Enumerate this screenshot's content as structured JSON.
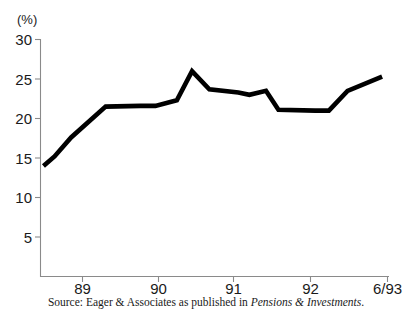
{
  "source_note": {
    "prefix": "Source: Eager & Associates as published in ",
    "publication": "Pensions & Investments",
    "suffix": "."
  },
  "chart_data": {
    "type": "line",
    "title": "",
    "subtitle": "",
    "xlabel": "",
    "ylabel": "",
    "unit_label": "(%)",
    "ylim": [
      0,
      30
    ],
    "yticks": [
      5,
      10,
      15,
      20,
      25,
      30
    ],
    "ytick_labels": [
      "5",
      "10",
      "15",
      "20",
      "25",
      "30"
    ],
    "xtick_labels": [
      "89",
      "90",
      "91",
      "92",
      "6/93"
    ],
    "xtick_values": [
      1989,
      1990,
      1991,
      1992,
      1993.5
    ],
    "xlim": [
      1988.55,
      1993.6
    ],
    "grid": false,
    "legend": null,
    "line_color": "#000000",
    "axis_color": "#8a8a8a",
    "series": [
      {
        "name": "Percent",
        "x": [
          1988.6,
          1988.76,
          1989.0,
          1989.5,
          1990.0,
          1990.22,
          1990.53,
          1990.75,
          1991.0,
          1991.42,
          1991.58,
          1991.82,
          1992.0,
          1992.53,
          1992.73,
          1993.0,
          1993.5
        ],
        "values": [
          14.0,
          15.2,
          17.6,
          21.5,
          21.6,
          21.6,
          22.3,
          26.0,
          23.7,
          23.3,
          23.0,
          23.5,
          21.1,
          21.0,
          21.0,
          23.5,
          25.3
        ]
      }
    ]
  }
}
